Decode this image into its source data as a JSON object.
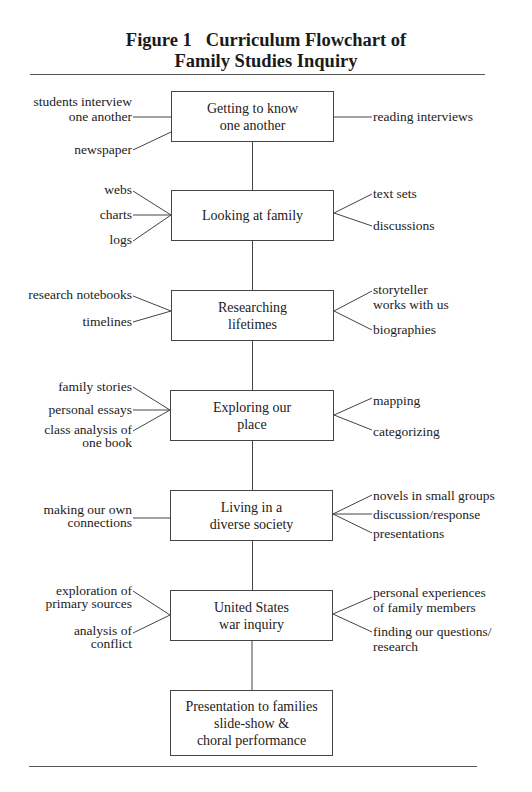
{
  "figure": {
    "number": "Figure 1",
    "title_line1": "Curriculum Flowchart of",
    "title_line2": "Family Studies Inquiry"
  },
  "nodes": [
    {
      "id": "getting-to-know",
      "lines": [
        "Getting to know",
        "one another"
      ],
      "left": [
        {
          "lines": [
            "students interview",
            "one another"
          ]
        },
        {
          "lines": [
            "newspaper"
          ]
        }
      ],
      "right": [
        {
          "lines": [
            "reading interviews"
          ]
        }
      ]
    },
    {
      "id": "looking-at-family",
      "lines": [
        "Looking at family"
      ],
      "left": [
        {
          "lines": [
            "webs"
          ]
        },
        {
          "lines": [
            "charts"
          ]
        },
        {
          "lines": [
            "logs"
          ]
        }
      ],
      "right": [
        {
          "lines": [
            "text sets"
          ]
        },
        {
          "lines": [
            "discussions"
          ]
        }
      ]
    },
    {
      "id": "researching-lifetimes",
      "lines": [
        "Researching",
        "lifetimes"
      ],
      "left": [
        {
          "lines": [
            "research notebooks"
          ]
        },
        {
          "lines": [
            "timelines"
          ]
        }
      ],
      "right": [
        {
          "lines": [
            "storyteller",
            "works with us"
          ]
        },
        {
          "lines": [
            "biographies"
          ]
        }
      ]
    },
    {
      "id": "exploring-our-place",
      "lines": [
        "Exploring our",
        "place"
      ],
      "left": [
        {
          "lines": [
            "family stories"
          ]
        },
        {
          "lines": [
            "personal essays"
          ]
        },
        {
          "lines": [
            "class analysis of",
            "one book"
          ]
        }
      ],
      "right": [
        {
          "lines": [
            "mapping"
          ]
        },
        {
          "lines": [
            "categorizing"
          ]
        }
      ]
    },
    {
      "id": "living-in-diverse-society",
      "lines": [
        "Living in a",
        "diverse society"
      ],
      "left": [
        {
          "lines": [
            "making our own",
            "connections"
          ]
        }
      ],
      "right": [
        {
          "lines": [
            "novels in small groups"
          ]
        },
        {
          "lines": [
            "discussion/response"
          ]
        },
        {
          "lines": [
            "presentations"
          ]
        }
      ]
    },
    {
      "id": "us-war-inquiry",
      "lines": [
        "United States",
        "war inquiry"
      ],
      "left": [
        {
          "lines": [
            "exploration of",
            "primary sources"
          ]
        },
        {
          "lines": [
            "analysis of",
            "conflict"
          ]
        }
      ],
      "right": [
        {
          "lines": [
            "personal experiences",
            "of family members"
          ]
        },
        {
          "lines": [
            "finding our questions/",
            "research"
          ]
        }
      ]
    },
    {
      "id": "presentation-to-families",
      "lines": [
        "Presentation to families",
        "slide-show &",
        "choral performance"
      ],
      "left": [],
      "right": []
    }
  ],
  "colors": {
    "line": "#444444",
    "text": "#222222",
    "background": "#ffffff"
  }
}
